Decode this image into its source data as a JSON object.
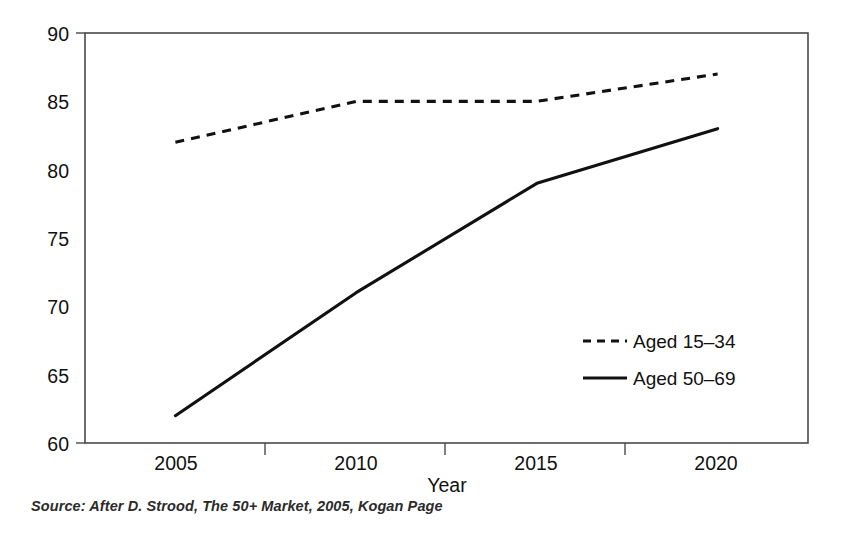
{
  "chart_data": {
    "type": "line",
    "title": "",
    "xlabel": "Year",
    "ylabel": "",
    "x": [
      2005,
      2010,
      2015,
      2020
    ],
    "categories": [
      "2005",
      "2010",
      "2015",
      "2020"
    ],
    "xtick_labels": [
      "2005",
      "2010",
      "2015",
      "2020"
    ],
    "ytick_labels": [
      "60",
      "65",
      "70",
      "75",
      "80",
      "85",
      "90"
    ],
    "ytick_values": [
      60,
      65,
      70,
      75,
      80,
      85,
      90
    ],
    "ylim": [
      60,
      90
    ],
    "xlim": [
      2002.5,
      2022.5
    ],
    "grid": false,
    "legend_position": "inside-right",
    "series": [
      {
        "name": "Aged 15–34",
        "style": "dashed",
        "color": "#111111",
        "values": [
          82,
          85,
          85,
          87
        ]
      },
      {
        "name": "Aged 50–69",
        "style": "solid",
        "color": "#111111",
        "values": [
          62,
          71,
          79,
          83
        ]
      }
    ]
  },
  "axes": {
    "x_title": "Year",
    "y_ticks": [
      "90",
      "85",
      "80",
      "75",
      "70",
      "65",
      "60"
    ],
    "x_ticks": [
      "2005",
      "2010",
      "2015",
      "2020"
    ]
  },
  "legend": {
    "entries": [
      {
        "label": "Aged 15–34",
        "style": "dashed"
      },
      {
        "label": "Aged 50–69",
        "style": "solid"
      }
    ]
  },
  "source": {
    "text": "Source:  After D. Strood, The 50+ Market,  2005, Kogan Page"
  },
  "colors": {
    "line": "#111111",
    "frame": "#4a4a4a",
    "background": "#ffffff"
  }
}
